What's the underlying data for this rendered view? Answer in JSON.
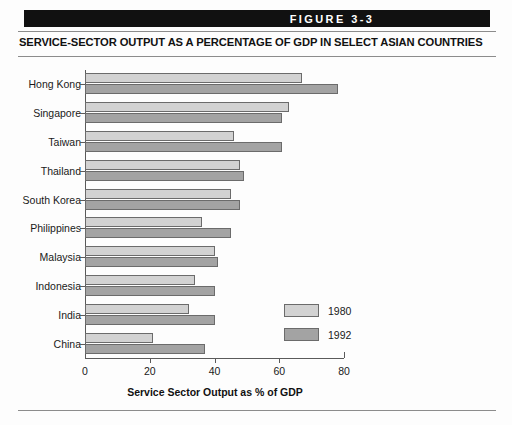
{
  "figure": {
    "banner_label": "FIGURE 3-3",
    "title": "SERVICE-SECTOR OUTPUT AS A PERCENTAGE OF GDP IN SELECT ASIAN COUNTRIES"
  },
  "legend": {
    "position": "inside-lower-right",
    "entries": [
      {
        "label": "1980",
        "color": "#d2d2d2"
      },
      {
        "label": "1992",
        "color": "#a3a3a3"
      }
    ]
  },
  "chart_data": {
    "type": "bar",
    "orientation": "horizontal",
    "title": "SERVICE-SECTOR OUTPUT AS A PERCENTAGE OF GDP IN SELECT ASIAN COUNTRIES",
    "xlabel": "Service Sector Output as % of GDP",
    "ylabel": "",
    "xlim": [
      0,
      80
    ],
    "xticks": [
      0,
      20,
      40,
      60,
      80
    ],
    "grid": false,
    "categories": [
      "Hong Kong",
      "Singapore",
      "Taiwan",
      "Thailand",
      "South Korea",
      "Philippines",
      "Malaysia",
      "Indonesia",
      "India",
      "China"
    ],
    "series": [
      {
        "name": "1980",
        "color": "#d2d2d2",
        "values": [
          67,
          63,
          46,
          48,
          45,
          36,
          40,
          34,
          32,
          21
        ]
      },
      {
        "name": "1992",
        "color": "#a3a3a3",
        "values": [
          78,
          61,
          61,
          49,
          48,
          45,
          41,
          40,
          40,
          37
        ]
      }
    ]
  }
}
